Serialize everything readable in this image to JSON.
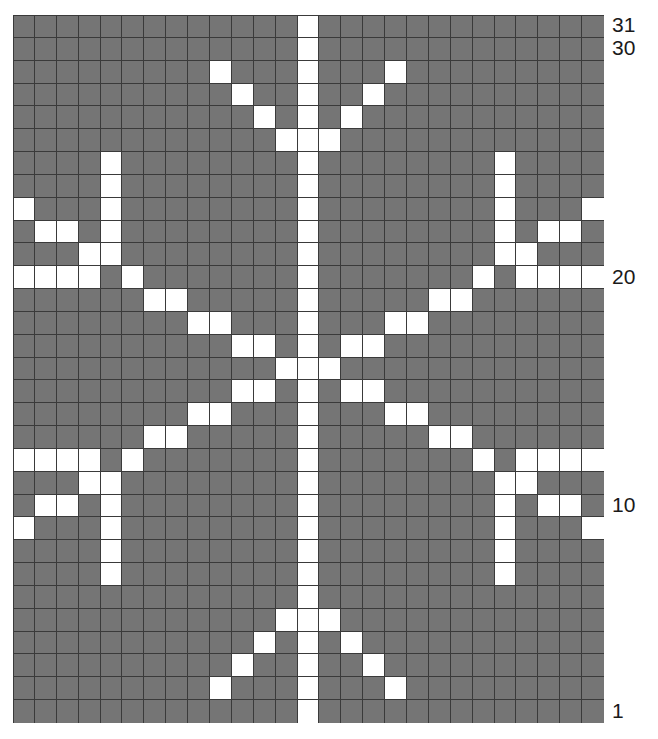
{
  "chart": {
    "type": "knitting-colorwork-grid",
    "columns": 27,
    "rows": 31,
    "background_color": "#757575",
    "foreground_color": "#ffffff",
    "gridline_color": "#3a3a3a",
    "label_color": "#1a1a1a",
    "row_numbering": "bottom-to-top",
    "row_labels": [
      {
        "row": 31,
        "text": "31"
      },
      {
        "row": 30,
        "text": "30"
      },
      {
        "row": 20,
        "text": "20"
      },
      {
        "row": 10,
        "text": "10"
      },
      {
        "row": 1,
        "text": "1"
      }
    ],
    "legend": {
      "background_meaning": "main color stitch",
      "foreground_meaning": "contrast color stitch"
    }
  },
  "chart_data": {
    "type": "heatmap",
    "xlabel": "",
    "ylabel": "",
    "grid": true,
    "legend_position": "none",
    "categories_x": [
      1,
      2,
      3,
      4,
      5,
      6,
      7,
      8,
      9,
      10,
      11,
      12,
      13,
      14,
      15,
      16,
      17,
      18,
      19,
      20,
      21,
      22,
      23,
      24,
      25,
      26,
      27
    ],
    "categories_y": [
      31,
      30,
      29,
      28,
      27,
      26,
      25,
      24,
      23,
      22,
      21,
      20,
      19,
      18,
      17,
      16,
      15,
      14,
      13,
      12,
      11,
      10,
      9,
      8,
      7,
      6,
      5,
      4,
      3,
      2,
      1
    ],
    "value_labels": {
      "0": "main color",
      "1": "contrast color"
    },
    "cells": [
      [
        0,
        0,
        0,
        0,
        0,
        0,
        0,
        0,
        0,
        0,
        0,
        0,
        0,
        1,
        0,
        0,
        0,
        0,
        0,
        0,
        0,
        0,
        0,
        0,
        0,
        0,
        0
      ],
      [
        0,
        0,
        0,
        0,
        0,
        0,
        0,
        0,
        0,
        0,
        0,
        0,
        0,
        1,
        0,
        0,
        0,
        0,
        0,
        0,
        0,
        0,
        0,
        0,
        0,
        0,
        0
      ],
      [
        0,
        0,
        0,
        0,
        0,
        0,
        0,
        0,
        0,
        1,
        0,
        0,
        0,
        1,
        0,
        0,
        0,
        1,
        0,
        0,
        0,
        0,
        0,
        0,
        0,
        0,
        0
      ],
      [
        0,
        0,
        0,
        0,
        0,
        0,
        0,
        0,
        0,
        0,
        1,
        0,
        0,
        1,
        0,
        0,
        1,
        0,
        0,
        0,
        0,
        0,
        0,
        0,
        0,
        0,
        0
      ],
      [
        0,
        0,
        0,
        0,
        0,
        0,
        0,
        0,
        0,
        0,
        0,
        1,
        0,
        1,
        0,
        1,
        0,
        0,
        0,
        0,
        0,
        0,
        0,
        0,
        0,
        0,
        0
      ],
      [
        0,
        0,
        0,
        0,
        0,
        0,
        0,
        0,
        0,
        0,
        0,
        0,
        1,
        1,
        1,
        0,
        0,
        0,
        0,
        0,
        0,
        0,
        0,
        0,
        0,
        0,
        0
      ],
      [
        0,
        0,
        0,
        0,
        1,
        0,
        0,
        0,
        0,
        0,
        0,
        0,
        0,
        1,
        0,
        0,
        0,
        0,
        0,
        0,
        0,
        0,
        1,
        0,
        0,
        0,
        0
      ],
      [
        0,
        0,
        0,
        0,
        1,
        0,
        0,
        0,
        0,
        0,
        0,
        0,
        0,
        1,
        0,
        0,
        0,
        0,
        0,
        0,
        0,
        0,
        1,
        0,
        0,
        0,
        0
      ],
      [
        1,
        0,
        0,
        0,
        1,
        0,
        0,
        0,
        0,
        0,
        0,
        0,
        0,
        1,
        0,
        0,
        0,
        0,
        0,
        0,
        0,
        0,
        1,
        0,
        0,
        0,
        1
      ],
      [
        0,
        1,
        1,
        0,
        1,
        0,
        0,
        0,
        0,
        0,
        0,
        0,
        0,
        1,
        0,
        0,
        0,
        0,
        0,
        0,
        0,
        0,
        1,
        0,
        1,
        1,
        0
      ],
      [
        0,
        0,
        0,
        1,
        1,
        0,
        0,
        0,
        0,
        0,
        0,
        0,
        0,
        1,
        0,
        0,
        0,
        0,
        0,
        0,
        0,
        0,
        1,
        1,
        0,
        0,
        0
      ],
      [
        1,
        1,
        1,
        1,
        0,
        1,
        0,
        0,
        0,
        0,
        0,
        0,
        0,
        1,
        0,
        0,
        0,
        0,
        0,
        0,
        0,
        1,
        0,
        1,
        1,
        1,
        1
      ],
      [
        0,
        0,
        0,
        0,
        0,
        0,
        1,
        1,
        0,
        0,
        0,
        0,
        0,
        1,
        0,
        0,
        0,
        0,
        0,
        1,
        1,
        0,
        0,
        0,
        0,
        0,
        0
      ],
      [
        0,
        0,
        0,
        0,
        0,
        0,
        0,
        0,
        1,
        1,
        0,
        0,
        0,
        1,
        0,
        0,
        0,
        1,
        1,
        0,
        0,
        0,
        0,
        0,
        0,
        0,
        0
      ],
      [
        0,
        0,
        0,
        0,
        0,
        0,
        0,
        0,
        0,
        0,
        1,
        1,
        0,
        1,
        0,
        1,
        1,
        0,
        0,
        0,
        0,
        0,
        0,
        0,
        0,
        0,
        0
      ],
      [
        0,
        0,
        0,
        0,
        0,
        0,
        0,
        0,
        0,
        0,
        0,
        0,
        1,
        1,
        1,
        0,
        0,
        0,
        0,
        0,
        0,
        0,
        0,
        0,
        0,
        0,
        0
      ],
      [
        0,
        0,
        0,
        0,
        0,
        0,
        0,
        0,
        0,
        0,
        1,
        1,
        0,
        1,
        0,
        1,
        1,
        0,
        0,
        0,
        0,
        0,
        0,
        0,
        0,
        0,
        0
      ],
      [
        0,
        0,
        0,
        0,
        0,
        0,
        0,
        0,
        1,
        1,
        0,
        0,
        0,
        1,
        0,
        0,
        0,
        1,
        1,
        0,
        0,
        0,
        0,
        0,
        0,
        0,
        0
      ],
      [
        0,
        0,
        0,
        0,
        0,
        0,
        1,
        1,
        0,
        0,
        0,
        0,
        0,
        1,
        0,
        0,
        0,
        0,
        0,
        1,
        1,
        0,
        0,
        0,
        0,
        0,
        0
      ],
      [
        1,
        1,
        1,
        1,
        0,
        1,
        0,
        0,
        0,
        0,
        0,
        0,
        0,
        1,
        0,
        0,
        0,
        0,
        0,
        0,
        0,
        1,
        0,
        1,
        1,
        1,
        1
      ],
      [
        0,
        0,
        0,
        1,
        1,
        0,
        0,
        0,
        0,
        0,
        0,
        0,
        0,
        1,
        0,
        0,
        0,
        0,
        0,
        0,
        0,
        0,
        1,
        1,
        0,
        0,
        0
      ],
      [
        0,
        1,
        1,
        0,
        1,
        0,
        0,
        0,
        0,
        0,
        0,
        0,
        0,
        1,
        0,
        0,
        0,
        0,
        0,
        0,
        0,
        0,
        1,
        0,
        1,
        1,
        0
      ],
      [
        1,
        0,
        0,
        0,
        1,
        0,
        0,
        0,
        0,
        0,
        0,
        0,
        0,
        1,
        0,
        0,
        0,
        0,
        0,
        0,
        0,
        0,
        1,
        0,
        0,
        0,
        1
      ],
      [
        0,
        0,
        0,
        0,
        1,
        0,
        0,
        0,
        0,
        0,
        0,
        0,
        0,
        1,
        0,
        0,
        0,
        0,
        0,
        0,
        0,
        0,
        1,
        0,
        0,
        0,
        0
      ],
      [
        0,
        0,
        0,
        0,
        1,
        0,
        0,
        0,
        0,
        0,
        0,
        0,
        0,
        1,
        0,
        0,
        0,
        0,
        0,
        0,
        0,
        0,
        1,
        0,
        0,
        0,
        0
      ],
      [
        0,
        0,
        0,
        0,
        0,
        0,
        0,
        0,
        0,
        0,
        0,
        0,
        0,
        1,
        0,
        0,
        0,
        0,
        0,
        0,
        0,
        0,
        0,
        0,
        0,
        0,
        0
      ],
      [
        0,
        0,
        0,
        0,
        0,
        0,
        0,
        0,
        0,
        0,
        0,
        0,
        1,
        1,
        1,
        0,
        0,
        0,
        0,
        0,
        0,
        0,
        0,
        0,
        0,
        0,
        0
      ],
      [
        0,
        0,
        0,
        0,
        0,
        0,
        0,
        0,
        0,
        0,
        0,
        1,
        0,
        1,
        0,
        1,
        0,
        0,
        0,
        0,
        0,
        0,
        0,
        0,
        0,
        0,
        0
      ],
      [
        0,
        0,
        0,
        0,
        0,
        0,
        0,
        0,
        0,
        0,
        1,
        0,
        0,
        1,
        0,
        0,
        1,
        0,
        0,
        0,
        0,
        0,
        0,
        0,
        0,
        0,
        0
      ],
      [
        0,
        0,
        0,
        0,
        0,
        0,
        0,
        0,
        0,
        1,
        0,
        0,
        0,
        1,
        0,
        0,
        0,
        1,
        0,
        0,
        0,
        0,
        0,
        0,
        0,
        0,
        0
      ],
      [
        0,
        0,
        0,
        0,
        0,
        0,
        0,
        0,
        0,
        0,
        0,
        0,
        0,
        1,
        0,
        0,
        0,
        0,
        0,
        0,
        0,
        0,
        0,
        0,
        0,
        0,
        0
      ]
    ]
  }
}
